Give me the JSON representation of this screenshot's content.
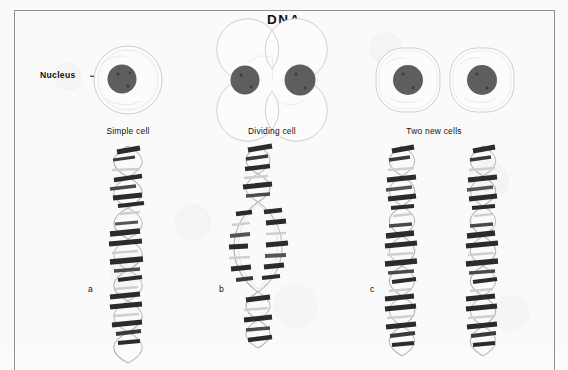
{
  "figure": {
    "title": "DNA",
    "frame_color": "#8e9092",
    "paper_color": "#fafafa",
    "ink_color": "#111111"
  },
  "annotations": {
    "nucleus_label": "Nucleus"
  },
  "cells": [
    {
      "id": "simple-cell",
      "caption": "Simple cell",
      "caption_x": 128,
      "caption_y": 130
    },
    {
      "id": "dividing-cell",
      "caption": "Dividing cell",
      "caption_x": 272,
      "caption_y": 130
    },
    {
      "id": "two-new-cells",
      "caption": "Two new cells",
      "caption_x": 434,
      "caption_y": 130
    }
  ],
  "helix_panels": [
    {
      "id": "helix-a",
      "letter": "a",
      "letter_x": 88,
      "letter_y": 286,
      "strands": 1,
      "state": "intact double helix"
    },
    {
      "id": "helix-b",
      "letter": "b",
      "letter_x": 219,
      "letter_y": 286,
      "strands": 1,
      "state": "unzipping, strands separating"
    },
    {
      "id": "helix-c",
      "letter": "c",
      "letter_x": 370,
      "letter_y": 286,
      "strands": 2,
      "state": "two identical double helices"
    }
  ],
  "colors": {
    "nucleus_fill": "#5e5e5e",
    "cell_outline": "#c9c9c9",
    "cell_fill": "#fcfcfc",
    "rung_dark": "#2b2b2b",
    "rung_mid": "#585858",
    "backbone": "#b6b6b6"
  }
}
